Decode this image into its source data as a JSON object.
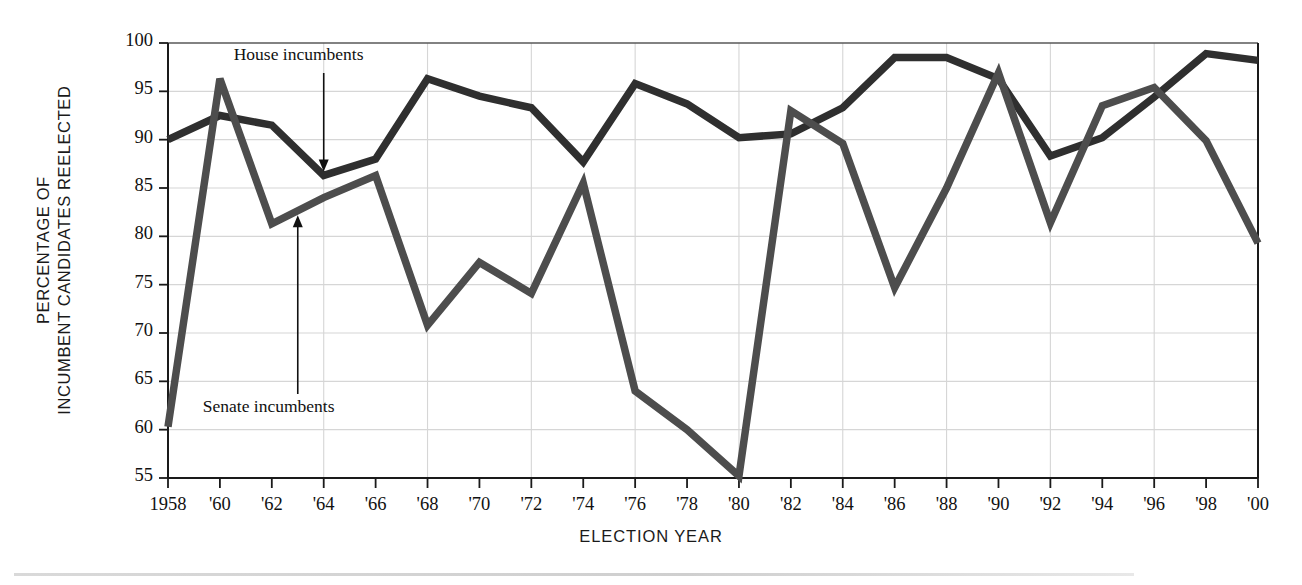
{
  "chart_data": {
    "type": "line",
    "title": "",
    "xlabel": "ELECTION YEAR",
    "ylabel": "PERCENTAGE OF INCUMBENT CANDIDATES REELECTED",
    "ylabel_lines": [
      "PERCENTAGE OF",
      "INCUMBENT CANDIDATES REELECTED"
    ],
    "xlim": [
      1958,
      2000
    ],
    "ylim": [
      55,
      100
    ],
    "yticks": [
      100,
      95,
      90,
      85,
      80,
      75,
      70,
      65,
      60,
      55
    ],
    "ytick_labels": [
      "100",
      "95",
      "90",
      "85",
      "80",
      "75",
      "70",
      "65",
      "60",
      "55"
    ],
    "x": [
      1958,
      1960,
      1962,
      1964,
      1966,
      1968,
      1970,
      1972,
      1974,
      1976,
      1978,
      1980,
      1982,
      1984,
      1986,
      1988,
      1990,
      1992,
      1994,
      1996,
      1998,
      2000
    ],
    "xtick_labels": [
      "1958",
      "'60",
      "'62",
      "'64",
      "'66",
      "'68",
      "'70",
      "'72",
      "'74",
      "'76",
      "'78",
      "'80",
      "'82",
      "'84",
      "'86",
      "'88",
      "'90",
      "'92",
      "'94",
      "'96",
      "'98",
      "'00"
    ],
    "grid": {
      "x_every_years": 4,
      "y_every": 5,
      "color": "#d6d6d6"
    },
    "legend_position": "inline-annotations",
    "series": [
      {
        "name": "House incumbents",
        "color": "#2f2f2f",
        "values": [
          90.0,
          92.5,
          91.5,
          86.3,
          88.0,
          96.3,
          94.5,
          93.3,
          87.7,
          95.8,
          93.7,
          90.2,
          90.6,
          93.3,
          98.5,
          98.5,
          96.3,
          88.3,
          90.2,
          94.4,
          98.9,
          98.2
        ]
      },
      {
        "name": "Senate incumbents",
        "color": "#4d4d4d",
        "values": [
          60.3,
          96.3,
          81.3,
          84.0,
          86.3,
          70.8,
          77.3,
          74.1,
          85.5,
          64.0,
          60.0,
          55.2,
          93.0,
          89.6,
          74.7,
          85.0,
          96.9,
          81.4,
          93.5,
          95.4,
          89.9,
          79.3
        ]
      }
    ],
    "annotations": [
      {
        "text": "House incumbents",
        "points_to_series": "House incumbents",
        "points_to_year": 1964,
        "arrow": "down"
      },
      {
        "text": "Senate incumbents",
        "points_to_series": "Senate incumbents",
        "points_to_year": 1963,
        "arrow": "up"
      }
    ]
  }
}
